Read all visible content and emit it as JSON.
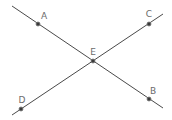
{
  "diagram": {
    "type": "intersecting-lines",
    "colors": {
      "line": "#4a4a4a",
      "point_fill": "#3a3a3a",
      "point_stroke": "#777777",
      "label": "#6b6b6b",
      "background": "#ffffff"
    },
    "lines": [
      {
        "name": "line-AB",
        "x1": 12,
        "y1": 6,
        "x2": 163,
        "y2": 108
      },
      {
        "name": "line-DC",
        "x1": 12,
        "y1": 115,
        "x2": 163,
        "y2": 14
      }
    ],
    "points": [
      {
        "label": "A",
        "x": 38,
        "y": 24,
        "lx": 44,
        "ly": 19
      },
      {
        "label": "C",
        "x": 149,
        "y": 24,
        "lx": 149,
        "ly": 17
      },
      {
        "label": "E",
        "x": 93,
        "y": 61,
        "lx": 93,
        "ly": 55
      },
      {
        "label": "B",
        "x": 149,
        "y": 99,
        "lx": 153,
        "ly": 94
      },
      {
        "label": "D",
        "x": 21,
        "y": 109,
        "lx": 22,
        "ly": 103
      }
    ]
  }
}
